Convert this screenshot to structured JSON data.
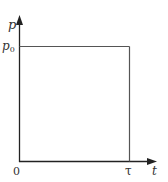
{
  "diagram": {
    "type": "step-pulse-graph",
    "y_axis": {
      "label": "p"
    },
    "x_axis": {
      "label": "t"
    },
    "labels": {
      "level_main": "p",
      "level_sub": "0",
      "origin": "0",
      "duration": "τ"
    },
    "pulse": {
      "start": "0",
      "end": "τ",
      "amplitude": "p0"
    },
    "colors": {
      "axis": "#222222",
      "pulse_line": "#555555",
      "text": "#333333"
    }
  }
}
